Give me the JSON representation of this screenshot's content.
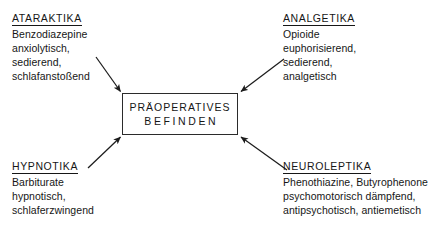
{
  "diagram": {
    "center": {
      "line1": "PRÄOPERATIVES",
      "line2": "BEFINDEN"
    },
    "groups": [
      {
        "id": "ataraktika",
        "heading": "ATARAKTIKA",
        "lines": [
          "Benzodiazepine",
          "anxiolytisch,",
          "sedierend,",
          "schlafanstoßend"
        ]
      },
      {
        "id": "analgetika",
        "heading": "ANALGETIKA",
        "lines": [
          "Opioide",
          "euphorisierend,",
          "sedierend,",
          "analgetisch"
        ]
      },
      {
        "id": "hypnotika",
        "heading": "HYPNOTIKA",
        "lines": [
          "Barbiturate",
          "hypnotisch,",
          "schlaferzwingend"
        ]
      },
      {
        "id": "neuroleptika",
        "heading": "NEUROLEPTIKA",
        "lines": [
          "Phenothiazine, Butyrophenone",
          "psychomotorisch dämpfend,",
          "antipsychotisch,  antiemetisch"
        ]
      }
    ],
    "colors": {
      "ink": "#161616",
      "box_border": "#2b2b2b",
      "background": "#ffffff"
    }
  }
}
